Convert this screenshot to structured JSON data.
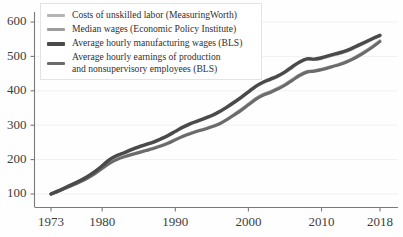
{
  "chart_data": {
    "type": "line",
    "title": "",
    "subtitle": "",
    "xlabel": "",
    "ylabel": "",
    "xlim": [
      1973,
      2018
    ],
    "ylim": [
      75,
      615
    ],
    "grid": true,
    "legend_position": "top-left",
    "index_base": "1973 = 100",
    "x_ticks": [
      "1973",
      "1980",
      "1990",
      "2000",
      "2010",
      "2018"
    ],
    "x_tick_values": [
      1973,
      1980,
      1990,
      2000,
      2010,
      2018
    ],
    "y_ticks": [
      "100",
      "200",
      "300",
      "400",
      "500",
      "600"
    ],
    "y_tick_values": [
      100,
      200,
      300,
      400,
      500,
      600
    ],
    "x": [
      1973,
      1974,
      1975,
      1976,
      1977,
      1978,
      1979,
      1980,
      1981,
      1982,
      1983,
      1984,
      1985,
      1986,
      1987,
      1988,
      1989,
      1990,
      1991,
      1992,
      1993,
      1994,
      1995,
      1996,
      1997,
      1998,
      1999,
      2000,
      2001,
      2002,
      2003,
      2004,
      2005,
      2006,
      2007,
      2008,
      2009,
      2010,
      2011,
      2012,
      2013,
      2014,
      2015,
      2016,
      2017,
      2018
    ],
    "series": [
      {
        "name": "Costs of unskilled labor (MeasuringWorth)",
        "color": "#b4b4b4",
        "width": 3.0,
        "values": [
          100,
          109,
          119,
          128,
          138,
          150,
          164,
          181,
          199,
          211,
          219,
          228,
          236,
          243,
          250,
          259,
          269,
          281,
          293,
          303,
          311,
          319,
          327,
          338,
          351,
          365,
          379,
          396,
          412,
          424,
          432,
          441,
          453,
          468,
          483,
          492,
          491,
          494,
          500,
          506,
          512,
          520,
          530,
          540,
          551,
          562
        ]
      },
      {
        "name": "Median wages (Economic Policy Institute)",
        "color": "#9d9d9d",
        "width": 2.6,
        "values": [
          100,
          108,
          117,
          126,
          136,
          147,
          160,
          175,
          190,
          201,
          209,
          216,
          222,
          228,
          234,
          241,
          249,
          259,
          269,
          277,
          284,
          290,
          297,
          305,
          317,
          331,
          346,
          362,
          378,
          390,
          398,
          408,
          419,
          433,
          447,
          457,
          459,
          463,
          469,
          475,
          482,
          491,
          503,
          516,
          530,
          546
        ]
      },
      {
        "name": "Average hourly manufacturing wages (BLS)",
        "color": "#4a4a4a",
        "width": 3.4,
        "values": [
          100,
          109,
          119,
          129,
          139,
          151,
          165,
          182,
          200,
          212,
          220,
          229,
          237,
          244,
          251,
          260,
          270,
          282,
          294,
          304,
          312,
          320,
          328,
          339,
          352,
          366,
          381,
          397,
          413,
          425,
          434,
          443,
          455,
          470,
          484,
          493,
          492,
          496,
          502,
          508,
          514,
          522,
          532,
          542,
          552,
          561
        ]
      },
      {
        "name": "Average hourly earnings of production\nand nonsupervisory employees (BLS)",
        "color": "#6b6b6b",
        "width": 3.0,
        "values": [
          100,
          108,
          117,
          126,
          135,
          146,
          159,
          174,
          189,
          200,
          208,
          214,
          220,
          226,
          232,
          239,
          247,
          257,
          267,
          275,
          282,
          288,
          295,
          303,
          315,
          329,
          343,
          359,
          375,
          387,
          395,
          405,
          416,
          430,
          444,
          454,
          457,
          461,
          467,
          473,
          480,
          489,
          500,
          513,
          527,
          543
        ]
      }
    ]
  },
  "legend": {
    "entries": [
      {
        "label": "Costs of unskilled labor (MeasuringWorth)",
        "color": "#b4b4b4",
        "two_line": false
      },
      {
        "label": "Median wages (Economic Policy Institute)",
        "color": "#9d9d9d",
        "two_line": false
      },
      {
        "label": "Average hourly manufacturing wages (BLS)",
        "color": "#4a4a4a",
        "two_line": false
      },
      {
        "label": "Average hourly earnings of production\nand nonsupervisory employees (BLS)",
        "color": "#6b6b6b",
        "two_line": true
      }
    ]
  }
}
